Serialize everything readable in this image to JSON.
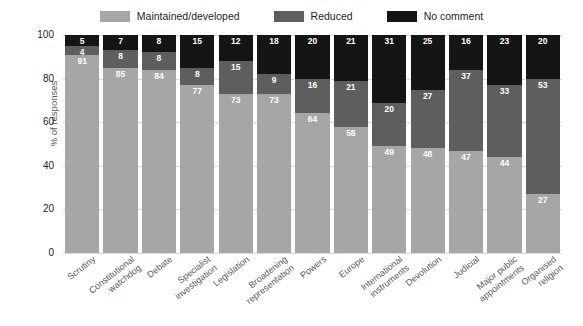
{
  "chart_data": {
    "type": "bar",
    "subtype": "stacked-bar-100",
    "title": "",
    "xlabel": "",
    "ylabel": "% of responses",
    "ylim": [
      0,
      100
    ],
    "yticks": [
      0,
      20,
      40,
      60,
      80,
      100
    ],
    "grid": true,
    "legend_position": "top-center",
    "categories": [
      "Scrutiny",
      "Constitutional\nwatchdog",
      "Debate",
      "Specialist\ninvestigation",
      "Legislation",
      "Broadening\nrepresentation",
      "Powers",
      "Europe",
      "International\ninstruments",
      "Devolution",
      "Judicial",
      "Major public\nappointments",
      "Organised\nreligion"
    ],
    "series": [
      {
        "name": "Maintained/developed",
        "color": "#a6a6a6",
        "values": [
          91,
          85,
          84,
          77,
          73,
          73,
          64,
          58,
          49,
          48,
          47,
          44,
          27
        ]
      },
      {
        "name": "Reduced",
        "color": "#5e5e5e",
        "values": [
          4,
          8,
          8,
          8,
          15,
          9,
          16,
          21,
          20,
          27,
          37,
          33,
          53
        ]
      },
      {
        "name": "No comment",
        "color": "#151515",
        "values": [
          5,
          7,
          8,
          15,
          12,
          18,
          20,
          21,
          31,
          25,
          16,
          23,
          20
        ]
      }
    ]
  },
  "colors": {
    "maintained": "#a6a6a6",
    "reduced": "#5e5e5e",
    "no_comment": "#151515",
    "gridline": "#d9d9d9",
    "text": "#231f20",
    "axis_text": "#58595b",
    "background": "#ffffff"
  }
}
